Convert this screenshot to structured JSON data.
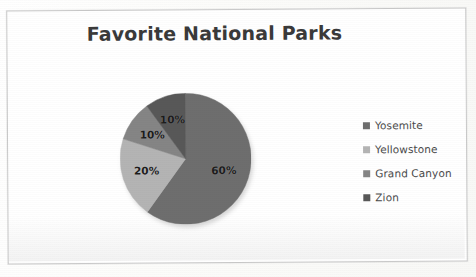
{
  "chart_data": {
    "type": "pie",
    "title": "Favorite National Parks",
    "categories": [
      "Yosemite",
      "Yellowstone",
      "Grand Canyon",
      "Zion"
    ],
    "values": [
      60,
      20,
      10,
      10
    ],
    "value_labels": [
      "60%",
      "20%",
      "10%",
      "10%"
    ],
    "unit": "%",
    "colors": [
      "#6e6e6e",
      "#b4b4b4",
      "#858585",
      "#585858"
    ],
    "legend_position": "right",
    "grid": false,
    "start_angle_deg": 0,
    "direction": "clockwise",
    "xlabel": "",
    "ylabel": ""
  },
  "chart": {
    "title": "Favorite National Parks",
    "slices": [
      {
        "name": "Yosemite",
        "label": "60%",
        "value": 60,
        "color": "#6e6e6e"
      },
      {
        "name": "Yellowstone",
        "label": "20%",
        "value": 20,
        "color": "#b4b4b4"
      },
      {
        "name": "Grand Canyon",
        "label": "10%",
        "value": 10,
        "color": "#858585"
      },
      {
        "name": "Zion",
        "label": "10%",
        "value": 10,
        "color": "#585858"
      }
    ]
  },
  "legend": {
    "items": [
      {
        "label": "Yosemite",
        "color": "#6e6e6e"
      },
      {
        "label": "Yellowstone",
        "color": "#b4b4b4"
      },
      {
        "label": "Grand Canyon",
        "color": "#858585"
      },
      {
        "label": "Zion",
        "color": "#585858"
      }
    ]
  }
}
